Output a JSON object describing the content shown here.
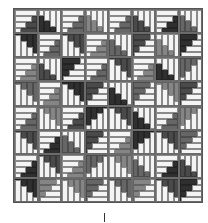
{
  "colors": {
    "light": "#f4f4f4",
    "grid": "#555555",
    "tones": [
      "#2f2f2f",
      "#4a4a4a",
      "#666666",
      "#858585"
    ]
  },
  "grid": {
    "rows": 8,
    "cols": 8
  },
  "blocks": [
    [
      "TL-h-1",
      "TR-v-0",
      "TL-h-2",
      "TR-v-3",
      "TL-h-2",
      "TR-v-1",
      "TL-h-0",
      "TR-v-2"
    ],
    [
      "BL-v-0",
      "TL-h-2",
      "BL-v-1",
      "TL-h-3",
      "TR-v-2",
      "BR-h-1",
      "TR-v-3",
      "BR-h-0"
    ],
    [
      "TL-h-3",
      "TR-v-1",
      "BR-h-0",
      "TL-h-2",
      "BL-v-1",
      "TL-h-3",
      "TR-v-0",
      "BR-v-2"
    ],
    [
      "BL-v-2",
      "TL-h-3",
      "BL-v-0",
      "BR-h-1",
      "TR-v-0",
      "BR-h-2",
      "BL-v-3",
      "BR-h-1"
    ],
    [
      "TL-h-2",
      "BL-v-3",
      "TL-h-1",
      "BR-v-0",
      "BL-v-1",
      "TR-v-0",
      "TL-h-2",
      "BR-v-3"
    ],
    [
      "BL-v-1",
      "TL-h-0",
      "TR-v-2",
      "BR-h-1",
      "TL-h-3",
      "BR-v-0",
      "BL-v-1",
      "BR-h-2"
    ],
    [
      "TL-h-0",
      "BL-v-1",
      "TL-h-3",
      "BR-v-2",
      "BL-v-3",
      "TR-v-2",
      "TL-h-0",
      "TR-v-1"
    ],
    [
      "BL-v-0",
      "BR-h-3",
      "BL-v-3",
      "BR-h-2",
      "BL-v-2",
      "BR-h-3",
      "BL-v-1",
      "BR-h-0"
    ]
  ]
}
